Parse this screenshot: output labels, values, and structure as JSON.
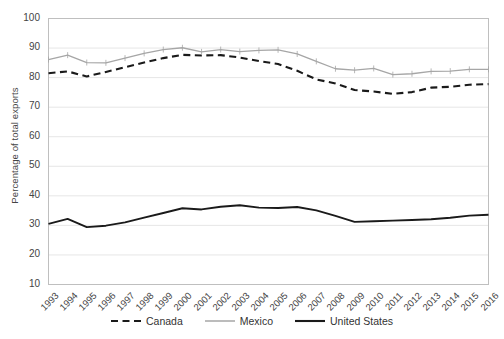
{
  "chart_data": {
    "type": "line",
    "title": "",
    "subtitle": "",
    "xlabel": "",
    "ylabel": "Percentage of total exports",
    "ylim": [
      10,
      100
    ],
    "ytick_step": 10,
    "yticks": [
      100,
      90,
      80,
      70,
      60,
      50,
      40,
      30,
      20,
      10
    ],
    "grid": true,
    "grid_axis": "y",
    "legend_position": "bottom",
    "x": [
      1993,
      1994,
      1995,
      1996,
      1997,
      1998,
      1999,
      2000,
      2001,
      2002,
      2003,
      2004,
      2005,
      2006,
      2007,
      2008,
      2009,
      2010,
      2011,
      2012,
      2013,
      2014,
      2015,
      2016
    ],
    "categories": [
      "1993",
      "1994",
      "1995",
      "1996",
      "1997",
      "1998",
      "1999",
      "2000",
      "2001",
      "2002",
      "2003",
      "2004",
      "2005",
      "2006",
      "2007",
      "2008",
      "2009",
      "2010",
      "2011",
      "2012",
      "2013",
      "2014",
      "2015",
      "2016"
    ],
    "series": [
      {
        "name": "Canada",
        "style": "dashed",
        "color": "#1a1a1a",
        "values": [
          81.5,
          82.1,
          80.4,
          81.9,
          83.5,
          85.1,
          86.6,
          87.7,
          87.5,
          87.6,
          86.8,
          85.6,
          84.6,
          82.3,
          79.4,
          78.0,
          75.8,
          75.3,
          74.5,
          75.1,
          76.6,
          76.9,
          77.6,
          77.8
        ]
      },
      {
        "name": "Mexico",
        "style": "solid-light",
        "color": "#a6a6a6",
        "values": [
          86.1,
          87.6,
          85.1,
          85.0,
          86.6,
          88.2,
          89.5,
          90.1,
          88.7,
          89.5,
          88.8,
          89.2,
          89.4,
          88.0,
          85.5,
          83.0,
          82.5,
          83.1,
          81.0,
          81.3,
          82.1,
          82.2,
          82.8,
          82.8
        ]
      },
      {
        "name": "United States",
        "style": "solid-bold",
        "color": "#1a1a1a",
        "values": [
          30.5,
          32.2,
          29.4,
          29.9,
          31.0,
          32.6,
          34.2,
          35.8,
          35.4,
          36.3,
          36.8,
          36.0,
          35.9,
          36.2,
          35.1,
          33.2,
          31.2,
          31.4,
          31.6,
          31.8,
          32.1,
          32.6,
          33.3,
          33.6
        ]
      }
    ]
  },
  "axis": {
    "ytick_labels": [
      "100",
      "90",
      "80",
      "70",
      "60",
      "50",
      "40",
      "30",
      "20",
      "10"
    ],
    "xtick_labels": [
      "1993",
      "1994",
      "1995",
      "1996",
      "1997",
      "1998",
      "1999",
      "2000",
      "2001",
      "2002",
      "2003",
      "2004",
      "2005",
      "2006",
      "2007",
      "2008",
      "2009",
      "2010",
      "2011",
      "2012",
      "2013",
      "2014",
      "2015",
      "2016"
    ],
    "ylabel": "Percentage of total exports"
  },
  "legend": {
    "items": [
      {
        "label": "Canada",
        "key": "dashed-line-key"
      },
      {
        "label": "Mexico",
        "key": "light-solid-line-key"
      },
      {
        "label": "United States",
        "key": "bold-solid-line-key"
      }
    ]
  }
}
